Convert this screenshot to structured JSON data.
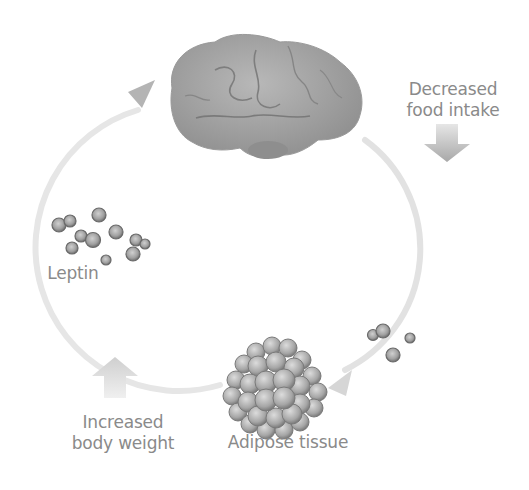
{
  "diagram": {
    "nodes": {
      "brain": {
        "label": ""
      },
      "adipose": {
        "label": "Adipose tissue"
      },
      "leptin": {
        "label": "Leptin"
      }
    },
    "annotations": {
      "decreased_food_intake": {
        "line1": "Decreased",
        "line2": "food intake",
        "arrow": "down"
      },
      "increased_body_weight": {
        "line1": "Increased",
        "line2": "body weight",
        "arrow": "up"
      }
    },
    "cycle": [
      {
        "from": "brain",
        "to": "adipose",
        "direction": "clockwise"
      },
      {
        "from": "adipose",
        "to": "brain",
        "direction": "clockwise"
      }
    ],
    "colors": {
      "text": "#8a8a8a",
      "arc": "#e4e4e4",
      "brain": "#9a9a9a",
      "cells": "#a8a8a8",
      "arrow_fill": "#c8c8c8"
    }
  }
}
